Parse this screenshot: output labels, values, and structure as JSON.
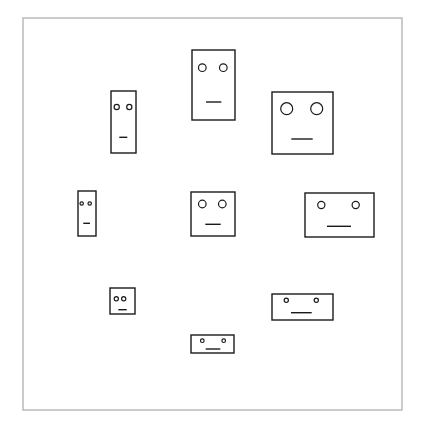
{
  "canvas": {
    "width": 424,
    "height": 430,
    "background": "#ffffff"
  },
  "frame": {
    "x": 23,
    "y": 18,
    "width": 379,
    "height": 392,
    "stroke": "#b0b0b0",
    "stroke_width": 1.3
  },
  "style": {
    "stroke": "#1a1a1a",
    "face_stroke_width": 1.4,
    "eye_stroke_width": 1.2,
    "mouth_stroke_width": 1.4
  },
  "faces": [
    {
      "id": "face-tall-left-upper",
      "x": 111,
      "y": 91,
      "w": 25,
      "h": 62,
      "eyes": [
        {
          "cx": 116.7,
          "cy": 107,
          "r": 2.6
        },
        {
          "cx": 129.3,
          "cy": 107,
          "r": 2.6
        }
      ],
      "mouth": {
        "x1": 119.3,
        "x2": 127.3,
        "y": 137.3
      }
    },
    {
      "id": "face-top-center",
      "x": 192,
      "y": 50,
      "w": 43,
      "h": 70,
      "eyes": [
        {
          "cx": 202.3,
          "cy": 67.7,
          "r": 3.8
        },
        {
          "cx": 223.3,
          "cy": 67.7,
          "r": 3.8
        }
      ],
      "mouth": {
        "x1": 206,
        "x2": 221.3,
        "y": 102
      }
    },
    {
      "id": "face-large-square-right",
      "x": 272,
      "y": 92,
      "w": 61,
      "h": 62,
      "eyes": [
        {
          "cx": 286.7,
          "cy": 108.7,
          "r": 6
        },
        {
          "cx": 316.7,
          "cy": 108.7,
          "r": 6
        }
      ],
      "mouth": {
        "x1": 291.3,
        "x2": 312.7,
        "y": 139
      }
    },
    {
      "id": "face-small-narrow-left",
      "x": 78,
      "y": 191,
      "w": 18,
      "h": 45,
      "eyes": [
        {
          "cx": 81.7,
          "cy": 203.5,
          "r": 1.7
        },
        {
          "cx": 89.7,
          "cy": 203.5,
          "r": 1.7
        }
      ],
      "mouth": {
        "x1": 83.3,
        "x2": 90,
        "y": 223.3
      }
    },
    {
      "id": "face-center-square",
      "x": 191,
      "y": 192,
      "w": 44,
      "h": 44,
      "eyes": [
        {
          "cx": 202.3,
          "cy": 204,
          "r": 3.8
        },
        {
          "cx": 222.3,
          "cy": 204,
          "r": 3.8
        }
      ],
      "mouth": {
        "x1": 205.3,
        "x2": 220.7,
        "y": 224.3
      }
    },
    {
      "id": "face-wide-right",
      "x": 305,
      "y": 193,
      "w": 69,
      "h": 44,
      "eyes": [
        {
          "cx": 321.3,
          "cy": 205,
          "r": 3.6
        },
        {
          "cx": 355.7,
          "cy": 205,
          "r": 3.6
        }
      ],
      "mouth": {
        "x1": 327,
        "x2": 351,
        "y": 226.3
      }
    },
    {
      "id": "face-small-square-lower-left",
      "x": 110,
      "y": 288,
      "w": 25,
      "h": 26,
      "eyes": [
        {
          "cx": 116.3,
          "cy": 298.7,
          "r": 2.1
        },
        {
          "cx": 123.7,
          "cy": 298.7,
          "r": 2.1
        }
      ],
      "mouth": {
        "x1": 118.3,
        "x2": 126.7,
        "y": 309.7
      }
    },
    {
      "id": "face-wide-lower-right",
      "x": 272,
      "y": 294,
      "w": 61,
      "h": 26,
      "eyes": [
        {
          "cx": 286.3,
          "cy": 300.3,
          "r": 2.1
        },
        {
          "cx": 316.3,
          "cy": 300.3,
          "r": 2.1
        }
      ],
      "mouth": {
        "x1": 291,
        "x2": 311.7,
        "y": 312.7
      }
    },
    {
      "id": "face-flat-bottom-center",
      "x": 191,
      "y": 335,
      "w": 43,
      "h": 18,
      "eyes": [
        {
          "cx": 202.3,
          "cy": 340.7,
          "r": 1.8
        },
        {
          "cx": 223.7,
          "cy": 340.7,
          "r": 1.8
        }
      ],
      "mouth": {
        "x1": 205.7,
        "x2": 220.3,
        "y": 349
      }
    }
  ]
}
